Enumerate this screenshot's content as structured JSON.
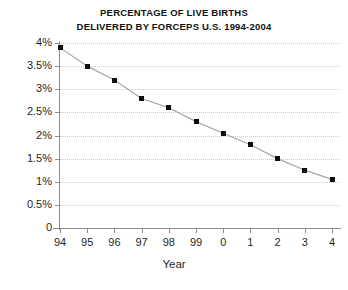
{
  "chart_data": {
    "type": "line",
    "title": "PERCENTAGE OF LIVE BIRTHS",
    "subtitle": "DELIVERED BY FORCEPS U.S. 1994-2004",
    "xlabel": "Year",
    "ylabel": "",
    "categories": [
      "94",
      "95",
      "96",
      "97",
      "98",
      "99",
      "0",
      "1",
      "2",
      "3",
      "4"
    ],
    "values": [
      3.9,
      3.5,
      3.2,
      2.8,
      2.6,
      2.3,
      2.05,
      1.8,
      1.5,
      1.25,
      1.05
    ],
    "ylim": [
      0,
      4
    ],
    "ytick_labels": [
      "0",
      "0.5%",
      "1%",
      "1.5%",
      "2%",
      "2.5%",
      "3%",
      "3.5%",
      "4%"
    ],
    "ytick_values": [
      0,
      0.5,
      1,
      1.5,
      2,
      2.5,
      3,
      3.5,
      4
    ],
    "grid": "horizontal-dotted",
    "legend": "none",
    "marker": "square",
    "series_color": "#0d0d0d",
    "line_color": "#a6a6a6",
    "grid_color": "#c9c9c9",
    "axis_color": "#8d8d8d",
    "background": "#ffffff"
  },
  "title_lines": [
    "PERCENTAGE OF LIVE BIRTHS",
    "DELIVERED BY FORCEPS U.S. 1994-2004"
  ]
}
